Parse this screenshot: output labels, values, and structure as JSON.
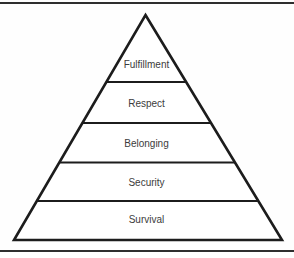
{
  "diagram": {
    "type": "pyramid-hierarchy",
    "levels": [
      {
        "label": "Fulfillment"
      },
      {
        "label": "Respect"
      },
      {
        "label": "Belonging"
      },
      {
        "label": "Security"
      },
      {
        "label": "Survival"
      }
    ],
    "colors": {
      "background": "#fefefe",
      "pyramid_fill": "#ffffff",
      "pyramid_stroke": "#1c1c1c",
      "label_text": "#3c3c3c",
      "frame_line": "#2e2e2e"
    }
  }
}
